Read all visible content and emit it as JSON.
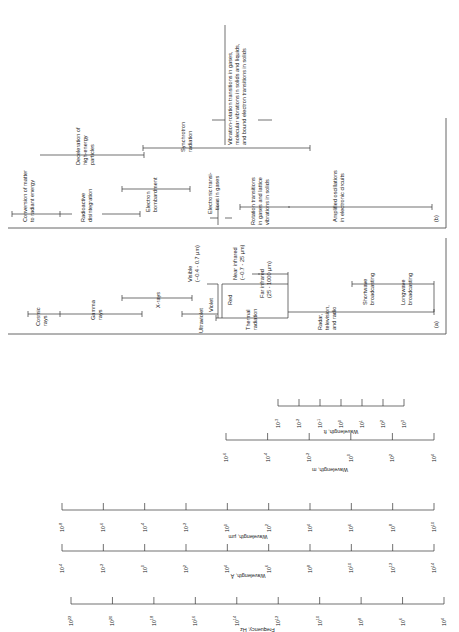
{
  "axes": [
    {
      "name": "frequency",
      "title": "Frequency, Hz",
      "ticks": [
        "10^22",
        "10^20",
        "10^18",
        "10^16",
        "10^14",
        "10^12",
        "10^10",
        "10^8",
        "10^6",
        "10^4"
      ]
    },
    {
      "name": "wavelength-angstrom",
      "title": "Wavelength, Å",
      "ticks": [
        "10^-4",
        "10^-2",
        "10^0",
        "10^2",
        "10^4",
        "10^6",
        "10^8",
        "10^10",
        "10^12",
        "10^14"
      ]
    },
    {
      "name": "wavelength-um",
      "title": "Wavelength, µm",
      "ticks": [
        "10^-8",
        "10^-6",
        "10^-4",
        "10^-2",
        "10^0",
        "10^2",
        "10^4",
        "10^6",
        "10^8",
        "10^10"
      ]
    },
    {
      "name": "wavelength-m",
      "title": "Wavelength, m",
      "ticks": [
        "10^-6",
        "10^-4",
        "10^-2",
        "10^0",
        "10^2",
        "10^4"
      ]
    },
    {
      "name": "wavelength-ft",
      "title": "Wavelength, ft",
      "ticks": [
        "10^-3",
        "10^-2",
        "10^-1",
        "10^0",
        "10^1",
        "10^2",
        "10^3"
      ]
    }
  ],
  "panel_a": {
    "tag": "(a)",
    "bands": [
      {
        "label": "Cosmic rays"
      },
      {
        "label": "Gamma rays"
      },
      {
        "label": "X-rays"
      },
      {
        "label": "Ultraviolet"
      },
      {
        "label": "Violet"
      },
      {
        "label": "Visible (~0.4 - 0.7 µm)"
      },
      {
        "label": "Red"
      },
      {
        "label": "Near infrared (~0.7 - 25 µm)"
      },
      {
        "label": "Thermal radiation"
      },
      {
        "label": "Far infrared (25 - 1000 µm)"
      },
      {
        "label": "Radar, television, and radio"
      },
      {
        "label": "Shortwave broadcasting"
      },
      {
        "label": "Longwave broadcasting"
      }
    ]
  },
  "panel_b": {
    "tag": "(b)",
    "sources": [
      {
        "label": "Conversion of matter to radiant energy"
      },
      {
        "label": "Radioactive disintegration"
      },
      {
        "label": "Deceleration of high-energy particles"
      },
      {
        "label": "Electron bombardment"
      },
      {
        "label": "Synchrotron radiation"
      },
      {
        "label": "Electronic transitions in gases"
      },
      {
        "label": "Vibration-rotation transitions in gases, molecular vibrations in solids and liquids, and bound electron transitions in solids"
      },
      {
        "label": "Rotation transitions in gases and lattice vibrations in solids"
      },
      {
        "label": "Amplified oscillations in electronic circuits"
      }
    ]
  }
}
